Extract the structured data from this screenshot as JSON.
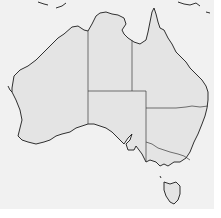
{
  "map": {
    "title": "",
    "region": "Australia",
    "type": "outline-map-with-state-borders",
    "colors": {
      "background": "#f1f1f1",
      "land": "#e4e4e4",
      "coastline": "#1a1a1a",
      "state_border": "#3a3a3a"
    },
    "regions": [
      {
        "id": "WA",
        "name": "Western Australia"
      },
      {
        "id": "NT",
        "name": "Northern Territory"
      },
      {
        "id": "SA",
        "name": "South Australia"
      },
      {
        "id": "QLD",
        "name": "Queensland"
      },
      {
        "id": "NSW",
        "name": "New South Wales"
      },
      {
        "id": "VIC",
        "name": "Victoria"
      },
      {
        "id": "TAS",
        "name": "Tasmania"
      }
    ],
    "labels": []
  }
}
